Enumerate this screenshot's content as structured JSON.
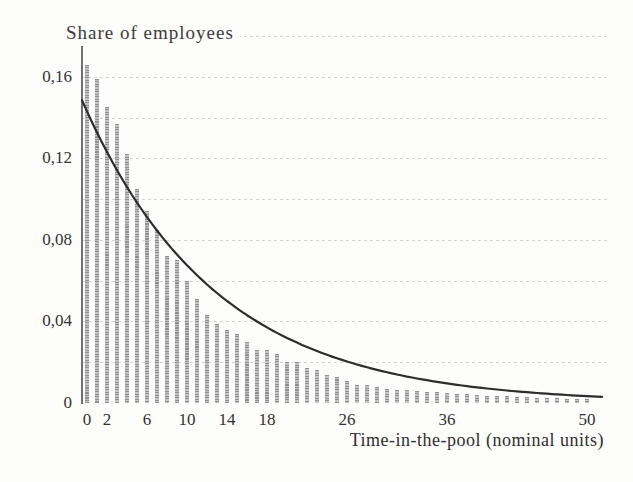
{
  "chart_data": {
    "type": "bar",
    "title": "Share of employees",
    "xlabel": "Time-in-the-pool (nominal units)",
    "ylabel": "Share of employees",
    "decimal_separator": ",",
    "xlim": [
      -0.5,
      52
    ],
    "ylim": [
      0,
      0.18
    ],
    "grid": "horizontal dotted lines every 0.02, no vertical grid, no x-axis baseline",
    "legend": "none",
    "x": [
      0,
      1,
      2,
      3,
      4,
      5,
      6,
      7,
      8,
      9,
      10,
      11,
      12,
      13,
      14,
      15,
      16,
      17,
      18,
      19,
      20,
      21,
      22,
      23,
      24,
      25,
      26,
      27,
      28,
      29,
      30,
      31,
      32,
      33,
      34,
      35,
      36,
      37,
      38,
      39,
      40,
      41,
      42,
      43,
      44,
      45,
      46,
      47,
      48,
      49,
      50
    ],
    "bar_series": {
      "name": "empirical share of employees by time in the pool",
      "values": [
        0.166,
        0.159,
        0.145,
        0.137,
        0.122,
        0.105,
        0.094,
        0.085,
        0.072,
        0.07,
        0.06,
        0.051,
        0.043,
        0.039,
        0.036,
        0.034,
        0.03,
        0.026,
        0.026,
        0.024,
        0.02,
        0.02,
        0.017,
        0.016,
        0.014,
        0.013,
        0.011,
        0.009,
        0.009,
        0.008,
        0.007,
        0.0065,
        0.0063,
        0.006,
        0.0056,
        0.0053,
        0.005,
        0.0046,
        0.0043,
        0.004,
        0.0037,
        0.0035,
        0.0033,
        0.0031,
        0.0029,
        0.0027,
        0.0025,
        0.0024,
        0.0022,
        0.0021,
        0.002
      ]
    },
    "line_series": {
      "name": "smooth exponential curve",
      "model": "v(t) = 0.143 * exp(-0.075 * t)",
      "y0": 0.143,
      "decay": 0.075,
      "t_start": -0.5,
      "t_end": 51.5,
      "sample_t": [
        0,
        5,
        10,
        15,
        20,
        25,
        30,
        35,
        40,
        45,
        50
      ],
      "sample_v": [
        0.143,
        0.0983,
        0.0676,
        0.0464,
        0.0319,
        0.0219,
        0.0151,
        0.0104,
        0.0071,
        0.0049,
        0.0034
      ]
    },
    "ytick_labels": [
      {
        "value": 0.0,
        "label": "0"
      },
      {
        "value": 0.04,
        "label": "0,04"
      },
      {
        "value": 0.08,
        "label": "0,08"
      },
      {
        "value": 0.12,
        "label": "0,12"
      },
      {
        "value": 0.16,
        "label": "0,16"
      }
    ],
    "gridline_values": [
      0.02,
      0.04,
      0.06,
      0.08,
      0.1,
      0.12,
      0.14,
      0.16,
      0.18
    ],
    "xtick_labels": [
      {
        "value": 0,
        "label": "0"
      },
      {
        "value": 2,
        "label": "2"
      },
      {
        "value": 6,
        "label": "6"
      },
      {
        "value": 10,
        "label": "10"
      },
      {
        "value": 14,
        "label": "14"
      },
      {
        "value": 18,
        "label": "18"
      },
      {
        "value": 26,
        "label": "26"
      },
      {
        "value": 36,
        "label": "36"
      },
      {
        "value": 50,
        "label": "50"
      }
    ],
    "colors": {
      "bar": "#9a9c9f",
      "curve": "#2d2d2d",
      "grid": "#d7d7d0",
      "axis": "#70716f",
      "text": "#333331",
      "background": "#fdfdfb"
    }
  }
}
